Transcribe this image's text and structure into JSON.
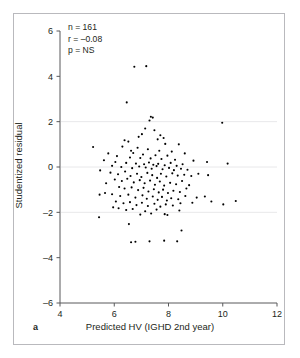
{
  "figure": {
    "panel_label": "a",
    "background": "#ffffff",
    "frame_color": "#b9b9bd",
    "dot_color": "#000000",
    "grid_color": "#e8e8ea"
  },
  "annotations": {
    "n": "n = 161",
    "r": "r = –0.08",
    "p": "p = NS"
  },
  "chart_data": {
    "type": "scatter",
    "title": "",
    "xlabel": "Predicted HV (IGHD 2nd year)",
    "ylabel": "Studentized residual",
    "xlim": [
      4,
      12
    ],
    "ylim": [
      -6,
      6
    ],
    "xticks": [
      4,
      6,
      8,
      10,
      12
    ],
    "yticks": [
      6,
      4,
      2,
      0,
      -2,
      -4,
      -6
    ],
    "xticklabels": [
      "4",
      "6",
      "8",
      "10",
      "12"
    ],
    "yticklabels": [
      "6",
      "4",
      "2",
      "0",
      "–2",
      "–4",
      "–6"
    ],
    "grid": "horizontal at y = 2, 0, -2",
    "gridlines_y": [
      2,
      0,
      -2
    ],
    "legend": "none",
    "n_points": 161,
    "correlation_r": -0.08,
    "p_value": "NS",
    "marker_size_px": 2.1,
    "points": [
      [
        6.74,
        4.42
      ],
      [
        7.18,
        4.45
      ],
      [
        6.46,
        2.85
      ],
      [
        7.35,
        2.22
      ],
      [
        7.42,
        2.18
      ],
      [
        7.3,
        2.05
      ],
      [
        9.98,
        1.95
      ],
      [
        7.14,
        1.7
      ],
      [
        7.48,
        1.62
      ],
      [
        7.02,
        1.45
      ],
      [
        7.7,
        1.4
      ],
      [
        6.9,
        1.33
      ],
      [
        6.38,
        1.18
      ],
      [
        6.52,
        1.12
      ],
      [
        7.6,
        1.22
      ],
      [
        7.82,
        1.28
      ],
      [
        7.88,
        1.02
      ],
      [
        8.38,
        1.0
      ],
      [
        6.3,
        0.9
      ],
      [
        5.22,
        0.88
      ],
      [
        6.86,
        0.85
      ],
      [
        7.24,
        0.78
      ],
      [
        7.66,
        0.72
      ],
      [
        8.12,
        0.68
      ],
      [
        8.6,
        0.6
      ],
      [
        6.62,
        0.72
      ],
      [
        6.7,
        0.62
      ],
      [
        7.06,
        0.55
      ],
      [
        7.52,
        0.52
      ],
      [
        7.96,
        0.5
      ],
      [
        5.78,
        0.6
      ],
      [
        6.1,
        0.48
      ],
      [
        6.58,
        0.42
      ],
      [
        6.96,
        0.4
      ],
      [
        7.34,
        0.38
      ],
      [
        7.74,
        0.35
      ],
      [
        8.24,
        0.32
      ],
      [
        8.92,
        0.28
      ],
      [
        9.42,
        0.22
      ],
      [
        10.18,
        0.15
      ],
      [
        6.04,
        0.22
      ],
      [
        6.44,
        0.18
      ],
      [
        6.8,
        0.15
      ],
      [
        7.1,
        0.12
      ],
      [
        7.28,
        0.2
      ],
      [
        7.44,
        0.1
      ],
      [
        7.62,
        0.14
      ],
      [
        7.86,
        0.08
      ],
      [
        8.08,
        0.18
      ],
      [
        8.3,
        0.05
      ],
      [
        8.52,
        0.12
      ],
      [
        5.62,
        0.3
      ],
      [
        5.92,
        0.05
      ],
      [
        6.26,
        0.0
      ],
      [
        6.66,
        -0.05
      ],
      [
        6.92,
        0.02
      ],
      [
        7.16,
        -0.02
      ],
      [
        7.38,
        -0.08
      ],
      [
        7.56,
        0.04
      ],
      [
        7.78,
        -0.1
      ],
      [
        8.02,
        -0.04
      ],
      [
        8.2,
        -0.14
      ],
      [
        8.46,
        -0.08
      ],
      [
        8.7,
        -0.12
      ],
      [
        5.48,
        -0.15
      ],
      [
        5.86,
        -0.25
      ],
      [
        6.14,
        -0.32
      ],
      [
        6.4,
        -0.2
      ],
      [
        6.6,
        -0.4
      ],
      [
        6.84,
        -0.3
      ],
      [
        7.0,
        -0.44
      ],
      [
        7.22,
        -0.26
      ],
      [
        7.4,
        -0.36
      ],
      [
        7.58,
        -0.48
      ],
      [
        7.72,
        -0.3
      ],
      [
        7.92,
        -0.42
      ],
      [
        8.14,
        -0.28
      ],
      [
        8.34,
        -0.38
      ],
      [
        8.58,
        -0.34
      ],
      [
        8.84,
        -0.4
      ],
      [
        9.1,
        -0.3
      ],
      [
        9.46,
        -0.36
      ],
      [
        6.02,
        -0.55
      ],
      [
        6.28,
        -0.62
      ],
      [
        6.48,
        -0.52
      ],
      [
        6.72,
        -0.68
      ],
      [
        6.94,
        -0.58
      ],
      [
        7.12,
        -0.72
      ],
      [
        7.32,
        -0.6
      ],
      [
        7.5,
        -0.78
      ],
      [
        7.68,
        -0.64
      ],
      [
        7.84,
        -0.82
      ],
      [
        8.06,
        -0.7
      ],
      [
        8.28,
        -0.76
      ],
      [
        8.5,
        -0.62
      ],
      [
        8.76,
        -0.8
      ],
      [
        5.7,
        -0.72
      ],
      [
        6.18,
        -0.88
      ],
      [
        6.38,
        -0.95
      ],
      [
        6.64,
        -0.9
      ],
      [
        6.88,
        -1.02
      ],
      [
        7.08,
        -0.92
      ],
      [
        7.26,
        -1.08
      ],
      [
        7.46,
        -0.98
      ],
      [
        7.64,
        -1.12
      ],
      [
        7.8,
        -1.0
      ],
      [
        7.98,
        -1.15
      ],
      [
        8.18,
        -1.05
      ],
      [
        8.42,
        -1.1
      ],
      [
        8.66,
        -0.95
      ],
      [
        5.92,
        -1.2
      ],
      [
        6.22,
        -1.28
      ],
      [
        6.52,
        -1.22
      ],
      [
        6.78,
        -1.35
      ],
      [
        7.04,
        -1.25
      ],
      [
        7.2,
        -1.4
      ],
      [
        7.42,
        -1.3
      ],
      [
        7.6,
        -1.45
      ],
      [
        7.76,
        -1.32
      ],
      [
        7.94,
        -1.48
      ],
      [
        8.1,
        -1.38
      ],
      [
        8.36,
        -1.42
      ],
      [
        8.62,
        -1.28
      ],
      [
        9.04,
        -1.35
      ],
      [
        9.34,
        -1.3
      ],
      [
        5.46,
        -1.22
      ],
      [
        5.66,
        -1.15
      ],
      [
        6.06,
        -1.52
      ],
      [
        6.34,
        -1.6
      ],
      [
        6.58,
        -1.55
      ],
      [
        6.82,
        -1.68
      ],
      [
        7.02,
        -1.58
      ],
      [
        7.24,
        -1.72
      ],
      [
        7.48,
        -1.62
      ],
      [
        7.7,
        -1.75
      ],
      [
        7.9,
        -1.65
      ],
      [
        8.16,
        -1.7
      ],
      [
        8.44,
        -1.6
      ],
      [
        8.88,
        -1.58
      ],
      [
        9.58,
        -1.52
      ],
      [
        10.02,
        -1.65
      ],
      [
        10.48,
        -1.5
      ],
      [
        5.96,
        -1.78
      ],
      [
        6.16,
        -1.82
      ],
      [
        6.44,
        -1.9
      ],
      [
        6.68,
        -1.85
      ],
      [
        7.14,
        -1.95
      ],
      [
        7.36,
        -2.05
      ],
      [
        7.56,
        -1.88
      ],
      [
        7.86,
        -2.08
      ],
      [
        8.4,
        -1.92
      ],
      [
        5.44,
        -2.22
      ],
      [
        6.54,
        -2.52
      ],
      [
        6.62,
        -3.32
      ],
      [
        6.78,
        -3.3
      ],
      [
        7.3,
        -3.28
      ],
      [
        7.84,
        -3.25
      ],
      [
        8.32,
        -3.28
      ],
      [
        8.48,
        -2.8
      ],
      [
        7.96,
        -2.12
      ],
      [
        6.96,
        -2.1
      ]
    ]
  }
}
